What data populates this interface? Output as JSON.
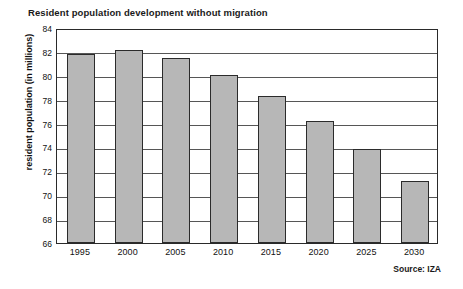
{
  "chart_data": {
    "type": "bar",
    "title": "Resident population development without migration",
    "xlabel": "",
    "ylabel": "resident population (in millions)",
    "categories": [
      "1995",
      "2000",
      "2005",
      "2010",
      "2015",
      "2020",
      "2025",
      "2030"
    ],
    "values": [
      81.8,
      82.2,
      81.5,
      80.1,
      78.3,
      76.2,
      73.9,
      71.2
    ],
    "ylim": [
      66,
      84
    ],
    "yticks": [
      66,
      68,
      70,
      72,
      74,
      76,
      78,
      80,
      82,
      84
    ],
    "grid": true,
    "legend": false,
    "bar_color": "#b7b7b7",
    "bar_border_color": "#2b2b2b",
    "annotation": "Source: IZA"
  }
}
